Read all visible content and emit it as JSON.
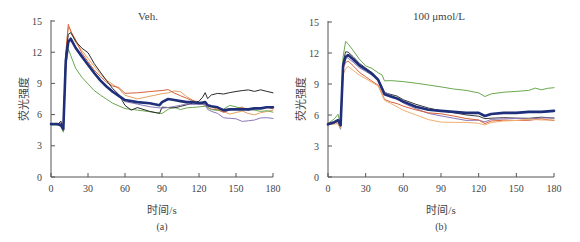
{
  "figure": {
    "panels": [
      {
        "id": "a",
        "title": "Veh.",
        "caption": "(a)",
        "xlabel": "时间/s",
        "ylabel": "荧光强度"
      },
      {
        "id": "b",
        "title": "100 μmol/L",
        "caption": "(b)",
        "xlabel": "时间/s",
        "ylabel": "荧光强度"
      }
    ]
  },
  "chart_data": [
    {
      "type": "line",
      "title": "Veh.",
      "panel_label": "(a)",
      "xlabel": "时间/s",
      "ylabel": "荧光强度",
      "xlim": [
        0,
        180
      ],
      "ylim": [
        0,
        15
      ],
      "xticks": [
        0,
        30,
        60,
        90,
        120,
        150,
        180
      ],
      "yticks": [
        0,
        3,
        6,
        9,
        12,
        15
      ],
      "grid": false,
      "legend": "none",
      "series": [
        {
          "name": "trace-orange",
          "color": "#e8a060",
          "width": 1,
          "x": [
            0,
            5,
            8,
            10,
            12,
            14,
            16,
            20,
            25,
            30,
            35,
            40,
            45,
            50,
            55,
            60,
            70,
            80,
            90,
            95,
            100,
            105,
            110,
            115,
            120,
            125,
            127,
            130,
            135,
            140,
            145,
            150,
            155,
            160,
            165,
            170,
            175,
            180
          ],
          "y": [
            5.0,
            5.1,
            5.0,
            4.6,
            12.0,
            14.5,
            14.2,
            13.0,
            12.2,
            11.4,
            10.6,
            9.8,
            9.2,
            8.8,
            8.4,
            7.8,
            7.5,
            7.8,
            8.1,
            8.2,
            8.4,
            8.3,
            7.8,
            7.4,
            7.2,
            7.0,
            6.8,
            6.6,
            6.4,
            6.2,
            6.0,
            6.2,
            6.4,
            6.2,
            6.1,
            6.3,
            6.4,
            6.5
          ]
        },
        {
          "name": "trace-red",
          "color": "#d9603a",
          "width": 1,
          "x": [
            0,
            5,
            8,
            10,
            12,
            14,
            16,
            20,
            25,
            30,
            35,
            40,
            45,
            50,
            55,
            60,
            70,
            80,
            90,
            95,
            100,
            105,
            110,
            115,
            120,
            125,
            127,
            130,
            135,
            140,
            145,
            150,
            155,
            160,
            165,
            170,
            175,
            180
          ],
          "y": [
            5.0,
            5.0,
            5.1,
            4.4,
            11.8,
            14.6,
            14.0,
            13.2,
            12.0,
            11.2,
            10.4,
            9.8,
            9.2,
            8.8,
            8.6,
            8.0,
            8.0,
            8.1,
            8.2,
            8.3,
            8.0,
            7.8,
            7.6,
            7.4,
            7.2,
            7.0,
            6.8,
            6.6,
            6.5,
            6.2,
            6.4,
            6.5,
            6.6,
            6.3,
            6.5,
            6.6,
            6.7,
            6.6
          ]
        },
        {
          "name": "trace-green",
          "color": "#6aa84f",
          "width": 1,
          "x": [
            0,
            5,
            8,
            10,
            12,
            14,
            16,
            20,
            25,
            30,
            35,
            40,
            45,
            50,
            55,
            60,
            70,
            80,
            90,
            95,
            100,
            105,
            110,
            115,
            120,
            125,
            127,
            130,
            135,
            140,
            145,
            150,
            155,
            160,
            165,
            170,
            175,
            180
          ],
          "y": [
            5.0,
            5.0,
            4.8,
            4.2,
            10.5,
            12.2,
            11.6,
            10.4,
            9.6,
            9.0,
            8.4,
            8.0,
            7.6,
            7.2,
            6.9,
            6.6,
            6.4,
            6.2,
            6.0,
            6.4,
            6.6,
            6.4,
            6.6,
            6.7,
            6.8,
            6.9,
            6.8,
            6.6,
            6.5,
            6.6,
            6.9,
            6.7,
            6.5,
            6.4,
            6.3,
            6.2,
            6.3,
            6.2
          ]
        },
        {
          "name": "trace-black",
          "color": "#2a2a2a",
          "width": 1,
          "x": [
            0,
            5,
            8,
            10,
            12,
            14,
            16,
            20,
            25,
            30,
            35,
            40,
            45,
            50,
            55,
            60,
            65,
            70,
            80,
            88,
            90,
            95,
            100,
            105,
            110,
            115,
            120,
            123,
            125,
            127,
            130,
            135,
            140,
            145,
            150,
            155,
            160,
            165,
            170,
            175,
            180
          ],
          "y": [
            5.1,
            5.0,
            5.3,
            4.5,
            11.5,
            13.6,
            13.8,
            13.0,
            12.4,
            12.0,
            11.0,
            10.2,
            9.4,
            8.6,
            8.0,
            6.9,
            6.4,
            6.6,
            6.2,
            6.0,
            6.6,
            6.6,
            6.6,
            6.8,
            7.0,
            7.2,
            7.4,
            7.8,
            8.2,
            7.6,
            7.9,
            8.0,
            7.9,
            8.0,
            8.1,
            8.2,
            8.3,
            8.2,
            8.4,
            8.3,
            8.2
          ]
        },
        {
          "name": "trace-purple",
          "color": "#8a78b8",
          "width": 1,
          "x": [
            0,
            5,
            8,
            10,
            12,
            14,
            16,
            20,
            25,
            30,
            35,
            40,
            45,
            50,
            55,
            60,
            70,
            80,
            90,
            95,
            100,
            105,
            110,
            115,
            120,
            125,
            127,
            130,
            135,
            140,
            145,
            150,
            155,
            160,
            165,
            170,
            175,
            180
          ],
          "y": [
            5.1,
            5.0,
            4.9,
            4.8,
            11.6,
            13.0,
            13.2,
            12.6,
            11.8,
            10.8,
            10.0,
            9.2,
            8.6,
            8.2,
            7.6,
            7.2,
            7.0,
            6.8,
            6.7,
            6.8,
            6.9,
            7.0,
            7.1,
            7.0,
            7.0,
            6.9,
            6.4,
            6.2,
            6.0,
            5.6,
            5.6,
            5.6,
            5.4,
            5.5,
            5.6,
            5.8,
            5.8,
            5.7
          ]
        },
        {
          "name": "mean",
          "color": "#1f2f7a",
          "width": 2.6,
          "x": [
            0,
            5,
            8,
            10,
            12,
            14,
            16,
            20,
            25,
            30,
            35,
            40,
            45,
            50,
            55,
            60,
            70,
            80,
            88,
            90,
            95,
            100,
            105,
            110,
            115,
            120,
            125,
            127,
            130,
            135,
            140,
            145,
            150,
            155,
            160,
            165,
            170,
            175,
            180
          ],
          "y": [
            5.1,
            5.1,
            5.0,
            4.6,
            11.2,
            13.0,
            13.3,
            12.4,
            11.6,
            10.8,
            10.0,
            9.3,
            8.7,
            8.2,
            7.8,
            7.4,
            7.2,
            7.1,
            6.9,
            7.2,
            7.5,
            7.4,
            7.3,
            7.2,
            7.2,
            7.1,
            7.2,
            6.9,
            6.8,
            6.7,
            6.4,
            6.5,
            6.5,
            6.5,
            6.5,
            6.6,
            6.6,
            6.7,
            6.7
          ]
        }
      ]
    },
    {
      "type": "line",
      "title": "100 μmol/L",
      "panel_label": "(b)",
      "xlabel": "时间/s",
      "ylabel": "荧光强度",
      "xlim": [
        0,
        180
      ],
      "ylim": [
        0,
        15
      ],
      "xticks": [
        0,
        30,
        60,
        90,
        120,
        150,
        180
      ],
      "yticks": [
        0,
        3,
        6,
        9,
        12,
        15
      ],
      "grid": false,
      "legend": "none",
      "series": [
        {
          "name": "trace-green",
          "color": "#6aa84f",
          "width": 1,
          "x": [
            0,
            5,
            8,
            10,
            12,
            14,
            16,
            20,
            25,
            30,
            35,
            40,
            43,
            45,
            50,
            55,
            60,
            70,
            80,
            90,
            100,
            110,
            120,
            125,
            130,
            140,
            150,
            160,
            165,
            170,
            175,
            180
          ],
          "y": [
            5.2,
            5.6,
            6.0,
            5.0,
            11.5,
            13.0,
            12.8,
            12.2,
            11.4,
            10.8,
            10.6,
            10.2,
            10.0,
            9.4,
            9.4,
            9.3,
            9.2,
            9.0,
            8.8,
            8.6,
            8.4,
            8.3,
            8.1,
            7.8,
            8.1,
            8.3,
            8.4,
            8.5,
            8.7,
            8.5,
            8.6,
            8.6
          ]
        },
        {
          "name": "trace-black",
          "color": "#3a3a3a",
          "width": 1,
          "x": [
            0,
            5,
            8,
            10,
            12,
            14,
            16,
            20,
            25,
            30,
            35,
            40,
            45,
            50,
            55,
            60,
            70,
            80,
            90,
            100,
            110,
            120,
            125,
            130,
            140,
            150,
            160,
            170,
            180
          ],
          "y": [
            5.1,
            5.2,
            5.4,
            4.8,
            11.0,
            12.0,
            12.0,
            11.6,
            11.0,
            10.6,
            10.2,
            9.6,
            8.3,
            8.1,
            7.9,
            7.5,
            7.0,
            6.6,
            6.3,
            6.1,
            5.9,
            5.8,
            5.6,
            5.7,
            5.8,
            5.8,
            5.8,
            5.9,
            5.8
          ]
        },
        {
          "name": "trace-purple",
          "color": "#8a78b8",
          "width": 1,
          "x": [
            0,
            5,
            8,
            10,
            12,
            14,
            16,
            20,
            25,
            30,
            35,
            40,
            45,
            50,
            55,
            60,
            70,
            80,
            90,
            100,
            110,
            120,
            125,
            130,
            140,
            150,
            160,
            170,
            180
          ],
          "y": [
            5.0,
            5.3,
            5.2,
            4.7,
            10.8,
            11.8,
            11.6,
            11.2,
            10.6,
            10.2,
            9.8,
            9.4,
            8.1,
            7.8,
            7.5,
            7.1,
            6.6,
            6.2,
            6.0,
            5.8,
            5.6,
            5.6,
            5.4,
            5.6,
            5.6,
            5.6,
            5.5,
            5.6,
            5.6
          ]
        },
        {
          "name": "trace-red",
          "color": "#d9603a",
          "width": 1,
          "x": [
            0,
            5,
            8,
            10,
            12,
            14,
            16,
            20,
            25,
            30,
            35,
            40,
            45,
            50,
            55,
            60,
            70,
            80,
            90,
            100,
            110,
            120,
            125,
            130,
            140,
            150,
            160,
            170,
            180
          ],
          "y": [
            5.2,
            5.1,
            5.3,
            4.9,
            10.4,
            11.0,
            11.2,
            10.8,
            10.2,
            9.8,
            9.4,
            9.0,
            7.6,
            7.3,
            7.1,
            6.8,
            6.4,
            6.1,
            6.0,
            5.8,
            5.6,
            5.5,
            5.2,
            5.5,
            5.6,
            5.6,
            5.6,
            5.7,
            5.5
          ]
        },
        {
          "name": "trace-orange",
          "color": "#f0b070",
          "width": 1,
          "x": [
            0,
            5,
            8,
            10,
            12,
            14,
            16,
            20,
            25,
            30,
            35,
            40,
            45,
            50,
            55,
            60,
            70,
            80,
            90,
            100,
            110,
            120,
            125,
            130,
            140,
            150,
            160,
            170,
            180
          ],
          "y": [
            5.0,
            5.1,
            5.2,
            4.8,
            10.0,
            10.6,
            10.8,
            10.4,
            9.9,
            9.5,
            9.1,
            8.7,
            7.3,
            7.0,
            6.7,
            6.4,
            6.0,
            5.6,
            5.4,
            5.4,
            5.4,
            5.3,
            5.1,
            5.3,
            5.4,
            5.4,
            5.5,
            5.4,
            5.4
          ]
        },
        {
          "name": "mean",
          "color": "#1f2f7a",
          "width": 2.6,
          "x": [
            0,
            5,
            8,
            10,
            12,
            14,
            16,
            20,
            25,
            30,
            35,
            40,
            45,
            50,
            55,
            60,
            70,
            80,
            90,
            100,
            110,
            120,
            125,
            130,
            140,
            150,
            160,
            170,
            180
          ],
          "y": [
            5.1,
            5.3,
            5.5,
            5.0,
            10.8,
            11.6,
            11.8,
            11.4,
            10.8,
            10.4,
            10.0,
            9.4,
            8.0,
            7.8,
            7.6,
            7.3,
            6.8,
            6.5,
            6.4,
            6.3,
            6.2,
            6.2,
            5.9,
            6.1,
            6.2,
            6.2,
            6.3,
            6.3,
            6.4
          ]
        }
      ]
    }
  ]
}
